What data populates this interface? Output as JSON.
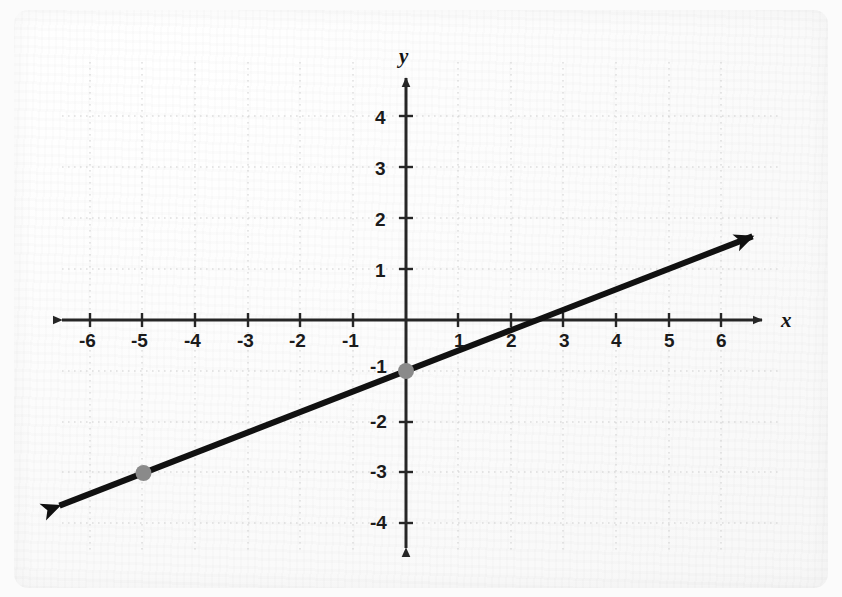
{
  "figure": {
    "background_color": "#fbfbfb",
    "paper_color": "#fcfcfc",
    "axis_color": "#262626",
    "grid_color": "#cfcfcf",
    "line_color": "#111111",
    "point_color": "#8a8a8a"
  },
  "axes": {
    "x_label": "x",
    "y_label": "y",
    "x_tick_labels": [
      "-6",
      "-5",
      "-4",
      "-3",
      "-2",
      "-1",
      "1",
      "2",
      "3",
      "4",
      "5",
      "6"
    ],
    "y_tick_labels": [
      "4",
      "3",
      "2",
      "1",
      "-1",
      "-2",
      "-3",
      "-4"
    ],
    "origin_label": ""
  },
  "chart_data": {
    "type": "line",
    "title": "",
    "xlabel": "x",
    "ylabel": "y",
    "xlim": [
      -6.7,
      6.7
    ],
    "ylim": [
      -4.5,
      4.5
    ],
    "xticks": [
      -6,
      -5,
      -4,
      -3,
      -2,
      -1,
      1,
      2,
      3,
      4,
      5,
      6
    ],
    "yticks": [
      4,
      3,
      2,
      1,
      -1,
      -2,
      -3,
      -4
    ],
    "grid": true,
    "grid_style": "dotted",
    "legend": "none",
    "series": [
      {
        "name": "line",
        "equation": "y = 0.4x - 1",
        "slope": 0.4,
        "intercept": -1,
        "x_intercept": 2.5,
        "arrows": "both",
        "x": [
          -6.6,
          6.6
        ],
        "y": [
          -3.64,
          1.64
        ]
      }
    ],
    "points": [
      {
        "label": "(0, -1)",
        "x": 0,
        "y": -1
      },
      {
        "label": "(-5, -3)",
        "x": -5,
        "y": -3
      }
    ]
  }
}
